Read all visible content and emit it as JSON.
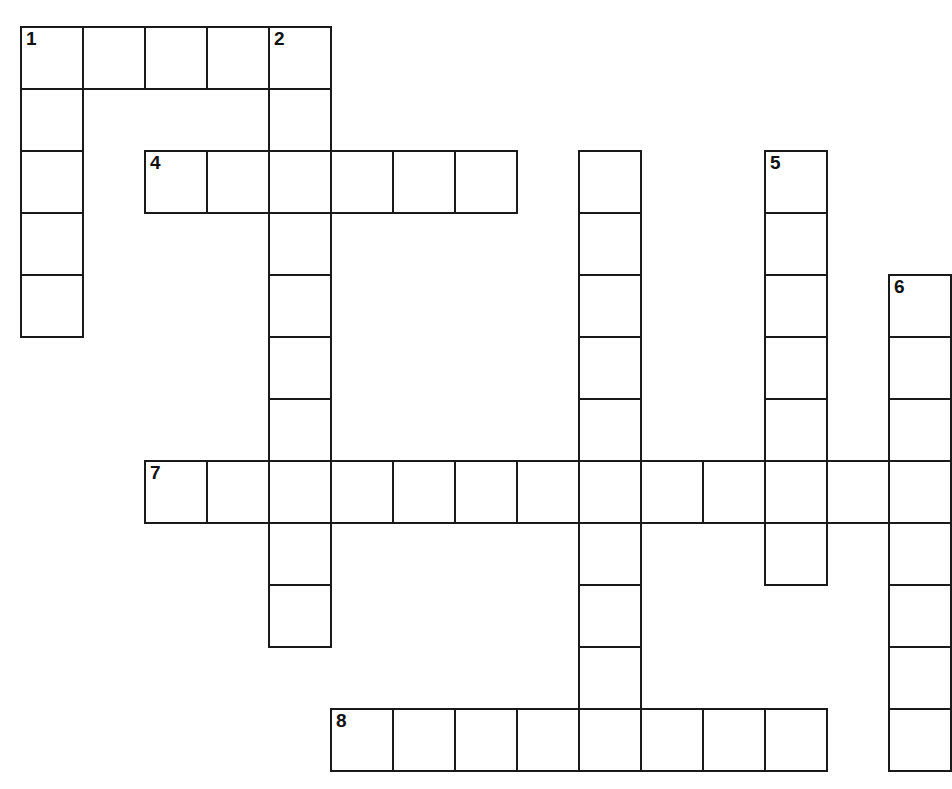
{
  "puzzle": {
    "type": "crossword-grid",
    "title": "Crossword puzzle grid",
    "background_color": "#ffffff",
    "line_color": "#1a1a1a",
    "cell_size": 62,
    "origin_x": 20,
    "origin_y": 26,
    "grid_columns": 15,
    "grid_rows": 13,
    "entries": [
      {
        "number": "1",
        "direction": "across",
        "col": 0,
        "row": 0,
        "length": 5
      },
      {
        "number": "1",
        "direction": "down",
        "col": 0,
        "row": 0,
        "length": 5
      },
      {
        "number": "2",
        "direction": "down",
        "col": 4,
        "row": 0,
        "length": 10
      },
      {
        "number": "3",
        "direction": "down",
        "col": 9,
        "row": 1,
        "length": 11
      },
      {
        "number": "4",
        "direction": "across",
        "col": 2,
        "row": 2,
        "length": 6
      },
      {
        "number": "5",
        "direction": "down",
        "col": 12,
        "row": 2,
        "length": 7
      },
      {
        "number": "6",
        "direction": "down",
        "col": 14,
        "row": 4,
        "length": 8
      },
      {
        "number": "7",
        "direction": "across",
        "col": 2,
        "row": 7,
        "length": 13
      },
      {
        "number": "8",
        "direction": "across",
        "col": 5,
        "row": 11,
        "length": 8
      }
    ],
    "numbered_cells": [
      {
        "number": "1",
        "col": 0,
        "row": 0
      },
      {
        "number": "2",
        "col": 4,
        "row": 0
      },
      {
        "number": "3",
        "col": 9,
        "row": 1
      },
      {
        "number": "4",
        "col": 2,
        "row": 2
      },
      {
        "number": "5",
        "col": 12,
        "row": 2
      },
      {
        "number": "6",
        "col": 14,
        "row": 4
      },
      {
        "number": "7",
        "col": 2,
        "row": 7
      },
      {
        "number": "8",
        "col": 5,
        "row": 11
      }
    ],
    "cells": [
      {
        "col": 0,
        "row": 0,
        "number": "1"
      },
      {
        "col": 1,
        "row": 0
      },
      {
        "col": 2,
        "row": 0
      },
      {
        "col": 3,
        "row": 0
      },
      {
        "col": 4,
        "row": 0,
        "number": "2"
      },
      {
        "col": 0,
        "row": 1
      },
      {
        "col": 4,
        "row": 1
      },
      {
        "col": 0,
        "row": 2
      },
      {
        "col": 2,
        "row": 2,
        "number": "4"
      },
      {
        "col": 3,
        "row": 2
      },
      {
        "col": 4,
        "row": 2
      },
      {
        "col": 5,
        "row": 2
      },
      {
        "col": 6,
        "row": 2
      },
      {
        "col": 7,
        "row": 2
      },
      {
        "col": 9,
        "row": 2
      },
      {
        "col": 12,
        "row": 2,
        "number": "5"
      },
      {
        "col": 0,
        "row": 3
      },
      {
        "col": 4,
        "row": 3
      },
      {
        "col": 9,
        "row": 3
      },
      {
        "col": 12,
        "row": 3
      },
      {
        "col": 0,
        "row": 4
      },
      {
        "col": 4,
        "row": 4
      },
      {
        "col": 9,
        "row": 4
      },
      {
        "col": 12,
        "row": 4
      },
      {
        "col": 14,
        "row": 4,
        "number": "6"
      },
      {
        "col": 4,
        "row": 5
      },
      {
        "col": 9,
        "row": 5
      },
      {
        "col": 12,
        "row": 5
      },
      {
        "col": 14,
        "row": 5
      },
      {
        "col": 4,
        "row": 6
      },
      {
        "col": 9,
        "row": 6
      },
      {
        "col": 12,
        "row": 6
      },
      {
        "col": 14,
        "row": 6
      },
      {
        "col": 2,
        "row": 7,
        "number": "7"
      },
      {
        "col": 3,
        "row": 7
      },
      {
        "col": 4,
        "row": 7
      },
      {
        "col": 5,
        "row": 7
      },
      {
        "col": 6,
        "row": 7
      },
      {
        "col": 7,
        "row": 7
      },
      {
        "col": 8,
        "row": 7
      },
      {
        "col": 9,
        "row": 7
      },
      {
        "col": 10,
        "row": 7
      },
      {
        "col": 11,
        "row": 7
      },
      {
        "col": 12,
        "row": 7
      },
      {
        "col": 13,
        "row": 7
      },
      {
        "col": 14,
        "row": 7
      },
      {
        "col": 4,
        "row": 8
      },
      {
        "col": 9,
        "row": 8
      },
      {
        "col": 12,
        "row": 8
      },
      {
        "col": 14,
        "row": 8
      },
      {
        "col": 4,
        "row": 9
      },
      {
        "col": 9,
        "row": 9
      },
      {
        "col": 14,
        "row": 9
      },
      {
        "col": 9,
        "row": 10
      },
      {
        "col": 14,
        "row": 10
      },
      {
        "col": 5,
        "row": 11,
        "number": "8"
      },
      {
        "col": 6,
        "row": 11
      },
      {
        "col": 7,
        "row": 11
      },
      {
        "col": 8,
        "row": 11
      },
      {
        "col": 9,
        "row": 11
      },
      {
        "col": 10,
        "row": 11
      },
      {
        "col": 11,
        "row": 11
      },
      {
        "col": 12,
        "row": 11
      },
      {
        "col": 14,
        "row": 11
      }
    ]
  }
}
